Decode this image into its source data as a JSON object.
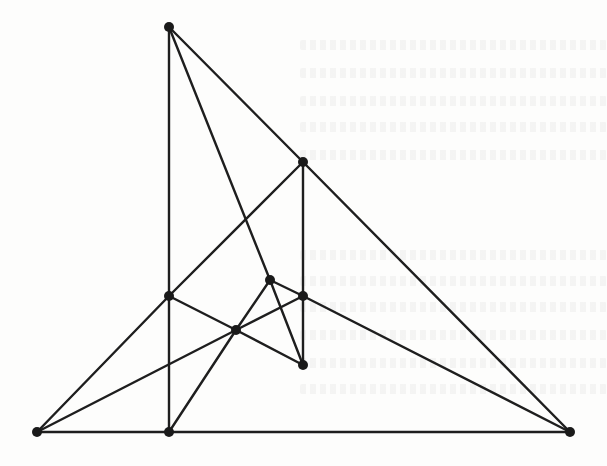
{
  "figure": {
    "type": "graph",
    "colors": {
      "edge": "#1e1e1e",
      "vertex": "#1a1a1a",
      "background": "#fdfdfc"
    },
    "vertex_radius": 5,
    "vertices": [
      {
        "id": "A",
        "x": 169,
        "y": 27
      },
      {
        "id": "B",
        "x": 303,
        "y": 162
      },
      {
        "id": "C",
        "x": 169,
        "y": 296
      },
      {
        "id": "D",
        "x": 270,
        "y": 280
      },
      {
        "id": "E",
        "x": 303,
        "y": 296
      },
      {
        "id": "F",
        "x": 236,
        "y": 330
      },
      {
        "id": "G",
        "x": 303,
        "y": 365
      },
      {
        "id": "H",
        "x": 37,
        "y": 432
      },
      {
        "id": "I",
        "x": 169,
        "y": 432
      },
      {
        "id": "J",
        "x": 570,
        "y": 432
      }
    ],
    "edges": [
      [
        "A",
        "C"
      ],
      [
        "C",
        "I"
      ],
      [
        "A",
        "B"
      ],
      [
        "B",
        "J"
      ],
      [
        "A",
        "D"
      ],
      [
        "D",
        "G"
      ],
      [
        "B",
        "C"
      ],
      [
        "B",
        "E"
      ],
      [
        "E",
        "G"
      ],
      [
        "C",
        "H"
      ],
      [
        "C",
        "F"
      ],
      [
        "F",
        "G"
      ],
      [
        "H",
        "F"
      ],
      [
        "F",
        "E"
      ],
      [
        "I",
        "F"
      ],
      [
        "F",
        "D"
      ],
      [
        "D",
        "E"
      ],
      [
        "E",
        "J"
      ],
      [
        "H",
        "I"
      ],
      [
        "I",
        "J"
      ]
    ]
  },
  "background_bleed_lines_y": [
    40,
    68,
    96,
    122,
    150,
    250,
    276,
    302,
    330,
    358,
    384
  ]
}
